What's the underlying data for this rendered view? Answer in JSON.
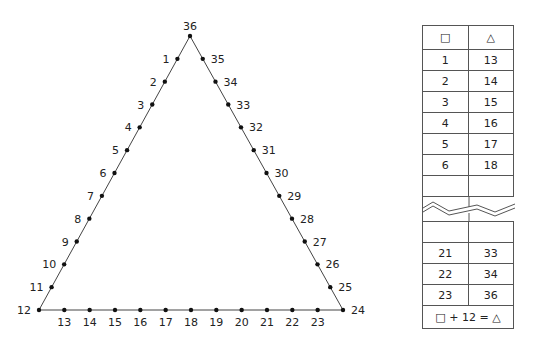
{
  "triangle": {
    "apex": {
      "label": "36",
      "x": 190,
      "y": 36
    },
    "bottom_left": {
      "label": "12",
      "x": 39,
      "y": 310
    },
    "bottom_right": {
      "label": "24",
      "x": 343,
      "y": 310
    },
    "left_side": [
      "1",
      "2",
      "3",
      "4",
      "5",
      "6",
      "7",
      "8",
      "9",
      "10",
      "11"
    ],
    "bottom_side": [
      "13",
      "14",
      "15",
      "16",
      "17",
      "18",
      "19",
      "20",
      "21",
      "22",
      "23"
    ],
    "right_side": [
      "25",
      "26",
      "27",
      "28",
      "29",
      "30",
      "31",
      "32",
      "33",
      "34",
      "35"
    ]
  },
  "table": {
    "header": {
      "col1": "□",
      "col2": "△"
    },
    "rows_top": [
      {
        "square": "1",
        "triangle": "13"
      },
      {
        "square": "2",
        "triangle": "14"
      },
      {
        "square": "3",
        "triangle": "15"
      },
      {
        "square": "4",
        "triangle": "16"
      },
      {
        "square": "5",
        "triangle": "17"
      },
      {
        "square": "6",
        "triangle": "18"
      }
    ],
    "rows_bottom": [
      {
        "square": "21",
        "triangle": "33"
      },
      {
        "square": "22",
        "triangle": "34"
      },
      {
        "square": "23",
        "triangle": "36"
      }
    ],
    "rule": "□ + 12 = △"
  }
}
